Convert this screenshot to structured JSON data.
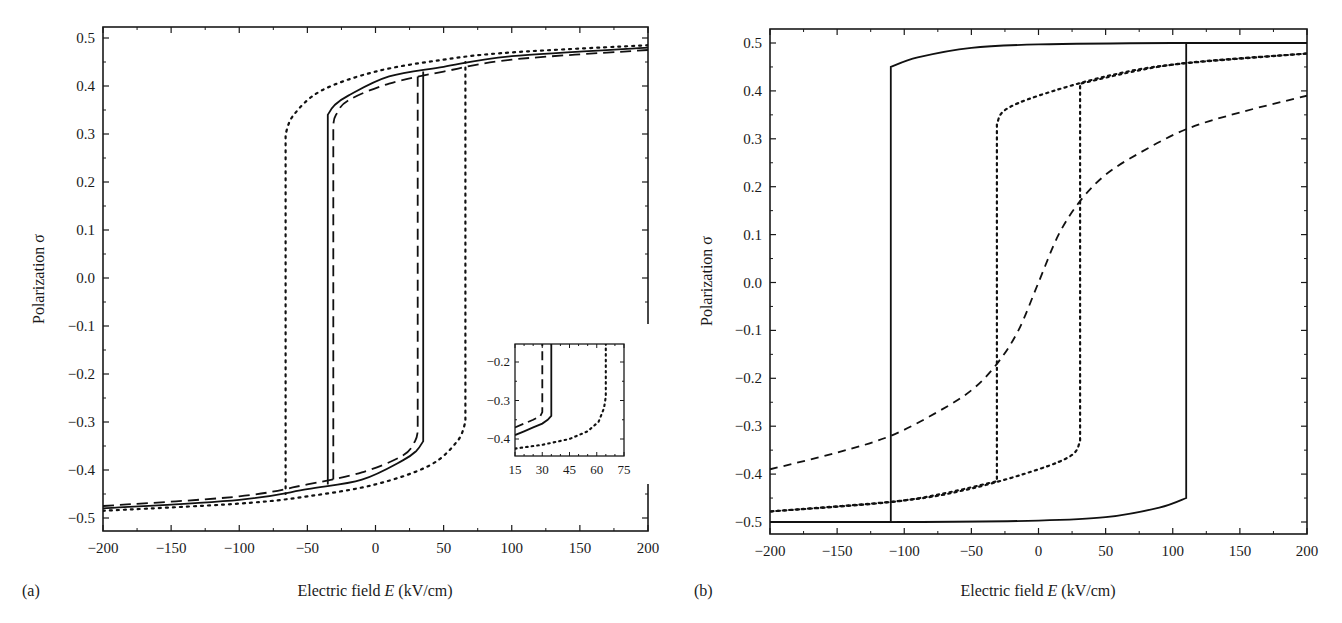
{
  "chart_data": [
    {
      "panel": "(a)",
      "type": "line",
      "title": "",
      "xlabel": "Electric field E (kV/cm)",
      "ylabel": "Polarization σ",
      "xlim": [
        -200,
        200
      ],
      "ylim": [
        -0.52,
        0.52
      ],
      "xticks": [
        -200,
        -150,
        -100,
        -50,
        0,
        50,
        100,
        150,
        200
      ],
      "yticks": [
        -0.5,
        -0.4,
        -0.3,
        -0.2,
        -0.1,
        0.0,
        0.1,
        0.2,
        0.3,
        0.4,
        0.5
      ],
      "grid": false,
      "legend": null,
      "series": [
        {
          "name": "solid",
          "style": "solid",
          "coercive_field": 35,
          "upper_branch": [
            [
              -200,
              -0.48
            ],
            [
              -100,
              -0.462
            ],
            [
              -50,
              -0.44
            ],
            [
              -10,
              -0.42
            ],
            [
              20,
              -0.38
            ],
            [
              30,
              -0.36
            ],
            [
              35,
              -0.34
            ],
            [
              35,
              0.43
            ]
          ],
          "lower_branch": [
            [
              200,
              0.48
            ],
            [
              100,
              0.462
            ],
            [
              50,
              0.44
            ],
            [
              10,
              0.42
            ],
            [
              -20,
              0.38
            ],
            [
              -30,
              0.36
            ],
            [
              -35,
              0.34
            ],
            [
              -35,
              -0.43
            ]
          ]
        },
        {
          "name": "dashed",
          "style": "dashed",
          "coercive_field": 31,
          "upper_branch": [
            [
              -200,
              -0.475
            ],
            [
              -100,
              -0.455
            ],
            [
              -50,
              -0.43
            ],
            [
              -10,
              -0.405
            ],
            [
              20,
              -0.37
            ],
            [
              29,
              -0.34
            ],
            [
              31,
              -0.32
            ],
            [
              31,
              0.42
            ]
          ],
          "lower_branch": [
            [
              200,
              0.475
            ],
            [
              100,
              0.455
            ],
            [
              50,
              0.43
            ],
            [
              10,
              0.405
            ],
            [
              -20,
              0.37
            ],
            [
              -29,
              0.34
            ],
            [
              -31,
              0.32
            ],
            [
              -31,
              -0.42
            ]
          ]
        },
        {
          "name": "dotted",
          "style": "dotted",
          "coercive_field": 66,
          "upper_branch": [
            [
              -200,
              -0.485
            ],
            [
              -100,
              -0.47
            ],
            [
              -50,
              -0.455
            ],
            [
              0,
              -0.43
            ],
            [
              40,
              -0.39
            ],
            [
              60,
              -0.34
            ],
            [
              66,
              -0.3
            ],
            [
              66,
              0.45
            ]
          ],
          "lower_branch": [
            [
              200,
              0.485
            ],
            [
              100,
              0.47
            ],
            [
              50,
              0.455
            ],
            [
              0,
              0.43
            ],
            [
              -40,
              0.39
            ],
            [
              -60,
              0.34
            ],
            [
              -66,
              0.3
            ],
            [
              -66,
              -0.45
            ]
          ]
        }
      ],
      "inset": {
        "xlim": [
          15,
          75
        ],
        "ylim": [
          -0.45,
          -0.15
        ],
        "xticks": [
          15,
          30,
          45,
          60,
          75
        ],
        "yticks": [
          -0.2,
          -0.3,
          -0.4
        ]
      }
    },
    {
      "panel": "(b)",
      "type": "line",
      "title": "",
      "xlabel": "Electric field E (kV/cm)",
      "ylabel": "Polarization σ",
      "xlim": [
        -200,
        200
      ],
      "ylim": [
        -0.52,
        0.52
      ],
      "xticks": [
        -200,
        -150,
        -100,
        -50,
        0,
        50,
        100,
        150,
        200
      ],
      "yticks": [
        -0.5,
        -0.4,
        -0.3,
        -0.2,
        -0.1,
        0.0,
        0.1,
        0.2,
        0.3,
        0.4,
        0.5
      ],
      "grid": false,
      "legend": null,
      "series": [
        {
          "name": "solid",
          "style": "solid",
          "coercive_field": 110,
          "upper_branch": [
            [
              -200,
              -0.5
            ],
            [
              -100,
              -0.5
            ],
            [
              0,
              -0.497
            ],
            [
              50,
              -0.49
            ],
            [
              90,
              -0.47
            ],
            [
              110,
              -0.45
            ],
            [
              110,
              0.5
            ],
            [
              200,
              0.5
            ]
          ],
          "lower_branch": [
            [
              200,
              0.5
            ],
            [
              100,
              0.5
            ],
            [
              0,
              0.497
            ],
            [
              -50,
              0.49
            ],
            [
              -90,
              0.47
            ],
            [
              -110,
              0.45
            ],
            [
              -110,
              -0.5
            ],
            [
              -200,
              -0.5
            ]
          ]
        },
        {
          "name": "dotted",
          "style": "dotted",
          "coercive_field": 31,
          "upper_branch": [
            [
              -200,
              -0.478
            ],
            [
              -100,
              -0.455
            ],
            [
              -50,
              -0.43
            ],
            [
              0,
              -0.39
            ],
            [
              25,
              -0.36
            ],
            [
              31,
              -0.33
            ],
            [
              31,
              0.415
            ],
            [
              100,
              0.455
            ],
            [
              200,
              0.478
            ]
          ],
          "lower_branch": [
            [
              200,
              0.478
            ],
            [
              100,
              0.455
            ],
            [
              50,
              0.43
            ],
            [
              0,
              0.39
            ],
            [
              -25,
              0.36
            ],
            [
              -31,
              0.33
            ],
            [
              -31,
              -0.415
            ],
            [
              -100,
              -0.455
            ],
            [
              -200,
              -0.478
            ]
          ]
        },
        {
          "name": "dashed",
          "style": "dashed",
          "anhysteretic": true,
          "points": [
            [
              -200,
              -0.39
            ],
            [
              -150,
              -0.355
            ],
            [
              -110,
              -0.32
            ],
            [
              -75,
              -0.27
            ],
            [
              -50,
              -0.225
            ],
            [
              -31,
              -0.17
            ],
            [
              -15,
              -0.1
            ],
            [
              0,
              0.0
            ],
            [
              15,
              0.1
            ],
            [
              31,
              0.17
            ],
            [
              50,
              0.225
            ],
            [
              75,
              0.27
            ],
            [
              110,
              0.32
            ],
            [
              150,
              0.355
            ],
            [
              200,
              0.39
            ]
          ]
        }
      ]
    }
  ],
  "panels": {
    "a": {
      "tag": "(a)",
      "xlabel_prefix": "Electric field ",
      "xlabel_var": "E",
      "xlabel_suffix": " (kV/cm)",
      "ylabel": "Polarization σ"
    },
    "b": {
      "tag": "(b)",
      "xlabel_prefix": "Electric field ",
      "xlabel_var": "E",
      "xlabel_suffix": " (kV/cm)",
      "ylabel": "Polarization σ"
    }
  }
}
